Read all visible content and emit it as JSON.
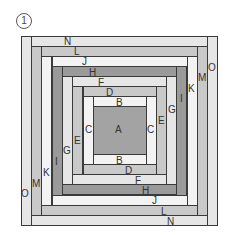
{
  "figure": {
    "number_badge": "1",
    "colors": {
      "light": "#e6e6e6",
      "pale": "#f3f3f3",
      "mid": "#c9c9c9",
      "dark": "#9a9a9a",
      "center": "#a3a3a3",
      "outline": "#3a3a3a"
    },
    "pieces": [
      {
        "id": "O-left",
        "label": "O",
        "x": 21,
        "y": 36,
        "w": 11,
        "h": 190,
        "tone": "light"
      },
      {
        "id": "O-right",
        "label": "",
        "x": 207,
        "y": 36,
        "w": 11,
        "h": 190,
        "tone": "light"
      },
      {
        "id": "N-top",
        "label": "N",
        "x": 31,
        "y": 36,
        "w": 177,
        "h": 11,
        "tone": "light"
      },
      {
        "id": "N-bottom",
        "label": "N",
        "x": 31,
        "y": 215,
        "w": 177,
        "h": 11,
        "tone": "light"
      },
      {
        "id": "M-left",
        "label": "M",
        "x": 31,
        "y": 46,
        "w": 11,
        "h": 170,
        "tone": "mid"
      },
      {
        "id": "M-right",
        "label": "M",
        "x": 197,
        "y": 46,
        "w": 11,
        "h": 170,
        "tone": "mid"
      },
      {
        "id": "L-top",
        "label": "L",
        "x": 41,
        "y": 46,
        "w": 157,
        "h": 11,
        "tone": "mid"
      },
      {
        "id": "L-bottom",
        "label": "L",
        "x": 41,
        "y": 205,
        "w": 157,
        "h": 11,
        "tone": "mid"
      },
      {
        "id": "K-left",
        "label": "K",
        "x": 41,
        "y": 56,
        "w": 11,
        "h": 150,
        "tone": "pale"
      },
      {
        "id": "K-right",
        "label": "K",
        "x": 187,
        "y": 56,
        "w": 11,
        "h": 150,
        "tone": "pale"
      },
      {
        "id": "J-top",
        "label": "J",
        "x": 52,
        "y": 56,
        "w": 136,
        "h": 11,
        "tone": "pale"
      },
      {
        "id": "J-bottom",
        "label": "J",
        "x": 52,
        "y": 195,
        "w": 136,
        "h": 11,
        "tone": "pale"
      },
      {
        "id": "I-left",
        "label": "I",
        "x": 52,
        "y": 66,
        "w": 11,
        "h": 130,
        "tone": "dark"
      },
      {
        "id": "I-right",
        "label": "I",
        "x": 176,
        "y": 66,
        "w": 11,
        "h": 130,
        "tone": "dark"
      },
      {
        "id": "H-top",
        "label": "H",
        "x": 62,
        "y": 66,
        "w": 115,
        "h": 11,
        "tone": "dark"
      },
      {
        "id": "H-bottom",
        "label": "H",
        "x": 62,
        "y": 184,
        "w": 115,
        "h": 11,
        "tone": "dark"
      },
      {
        "id": "G-left",
        "label": "G",
        "x": 62,
        "y": 76,
        "w": 11,
        "h": 109,
        "tone": "light"
      },
      {
        "id": "G-right",
        "label": "G",
        "x": 166,
        "y": 76,
        "w": 11,
        "h": 109,
        "tone": "light"
      },
      {
        "id": "F-top",
        "label": "F",
        "x": 72,
        "y": 76,
        "w": 95,
        "h": 11,
        "tone": "light"
      },
      {
        "id": "F-bottom",
        "label": "F",
        "x": 72,
        "y": 174,
        "w": 95,
        "h": 11,
        "tone": "light"
      },
      {
        "id": "E-left",
        "label": "E",
        "x": 72,
        "y": 86,
        "w": 11,
        "h": 89,
        "tone": "mid"
      },
      {
        "id": "E-right",
        "label": "E",
        "x": 156,
        "y": 86,
        "w": 11,
        "h": 89,
        "tone": "mid"
      },
      {
        "id": "D-top",
        "label": "D",
        "x": 83,
        "y": 86,
        "w": 74,
        "h": 11,
        "tone": "mid"
      },
      {
        "id": "D-bottom",
        "label": "D",
        "x": 83,
        "y": 164,
        "w": 74,
        "h": 11,
        "tone": "mid"
      },
      {
        "id": "C-left",
        "label": "C",
        "x": 83,
        "y": 96,
        "w": 11,
        "h": 69,
        "tone": "pale"
      },
      {
        "id": "C-right",
        "label": "C",
        "x": 146,
        "y": 96,
        "w": 11,
        "h": 69,
        "tone": "pale"
      },
      {
        "id": "B-top",
        "label": "B",
        "x": 93,
        "y": 96,
        "w": 54,
        "h": 11,
        "tone": "pale"
      },
      {
        "id": "B-bottom",
        "label": "B",
        "x": 93,
        "y": 154,
        "w": 54,
        "h": 11,
        "tone": "pale"
      },
      {
        "id": "A-center",
        "label": "A",
        "x": 93,
        "y": 106,
        "w": 54,
        "h": 49,
        "tone": "center"
      }
    ],
    "labels": [
      {
        "text": "N",
        "x": 64,
        "y": 37
      },
      {
        "text": "L",
        "x": 74,
        "y": 47
      },
      {
        "text": "J",
        "x": 82,
        "y": 57
      },
      {
        "text": "H",
        "x": 89,
        "y": 68
      },
      {
        "text": "F",
        "x": 98,
        "y": 78
      },
      {
        "text": "D",
        "x": 106,
        "y": 88
      },
      {
        "text": "B",
        "x": 116,
        "y": 98
      },
      {
        "text": "O",
        "x": 208,
        "y": 63
      },
      {
        "text": "M",
        "x": 198,
        "y": 73
      },
      {
        "text": "K",
        "x": 188,
        "y": 84
      },
      {
        "text": "I",
        "x": 180,
        "y": 94
      },
      {
        "text": "G",
        "x": 168,
        "y": 105
      },
      {
        "text": "E",
        "x": 158,
        "y": 116
      },
      {
        "text": "C",
        "x": 85,
        "y": 125
      },
      {
        "text": "A",
        "x": 115,
        "y": 125
      },
      {
        "text": "C",
        "x": 147,
        "y": 125
      },
      {
        "text": "E",
        "x": 74,
        "y": 136
      },
      {
        "text": "G",
        "x": 63,
        "y": 146
      },
      {
        "text": "I",
        "x": 55,
        "y": 157
      },
      {
        "text": "K",
        "x": 43,
        "y": 168
      },
      {
        "text": "M",
        "x": 32,
        "y": 179
      },
      {
        "text": "O",
        "x": 21,
        "y": 189
      },
      {
        "text": "B",
        "x": 116,
        "y": 156
      },
      {
        "text": "D",
        "x": 125,
        "y": 166
      },
      {
        "text": "F",
        "x": 135,
        "y": 176
      },
      {
        "text": "H",
        "x": 142,
        "y": 186
      },
      {
        "text": "J",
        "x": 152,
        "y": 196
      },
      {
        "text": "L",
        "x": 161,
        "y": 207
      },
      {
        "text": "N",
        "x": 167,
        "y": 217
      }
    ]
  }
}
